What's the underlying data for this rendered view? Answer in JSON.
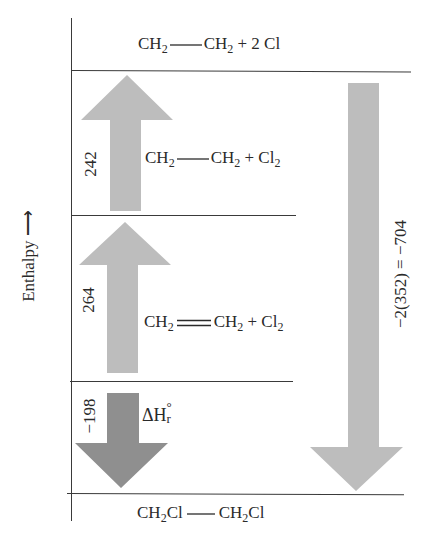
{
  "axis": {
    "label": "Enthalpy",
    "arrow_glyph": "⟶"
  },
  "levels": [
    {
      "id": "top",
      "formula_parts": [
        "CH",
        "2",
        "CH",
        "2",
        " + 2 Cl"
      ],
      "text": "CH2—CH2 + 2 Cl"
    },
    {
      "id": "second",
      "formula_parts": [
        "CH",
        "2",
        "CH",
        "2",
        " + Cl",
        "2"
      ],
      "text": "CH2—CH2 + Cl2"
    },
    {
      "id": "third",
      "formula_parts": [
        "CH",
        "2",
        "CH",
        "2",
        " + Cl",
        "2"
      ],
      "text": "CH2=CH2 + Cl2"
    },
    {
      "id": "bottom",
      "formula_parts": [
        "CH",
        "2",
        "Cl",
        "CH",
        "2",
        "Cl"
      ],
      "text": "CH2Cl—CH2Cl"
    }
  ],
  "arrows": [
    {
      "id": "bond-break-cl2",
      "direction": "up",
      "value": "242",
      "color": "#bdbdbd"
    },
    {
      "id": "pi-bond-break",
      "direction": "up",
      "value": "264",
      "color": "#bdbdbd"
    },
    {
      "id": "reaction-enthalpy",
      "direction": "down",
      "value": "−198",
      "label": "ΔH",
      "label_sup": "°",
      "label_sub": "r",
      "color": "#8f8f8f"
    },
    {
      "id": "c-cl-formation",
      "direction": "down",
      "value": "−2(352) = −704",
      "color": "#bdbdbd"
    }
  ],
  "colors": {
    "light_arrow": "#bdbdbd",
    "dark_arrow": "#8f8f8f",
    "lines": "#3a3a3a"
  }
}
